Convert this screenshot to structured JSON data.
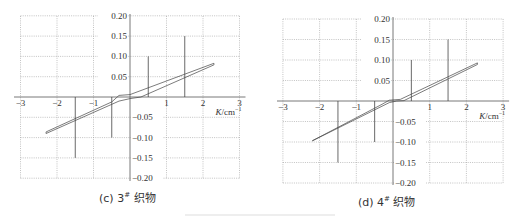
{
  "chart_data": [
    {
      "type": "line",
      "panel": "c",
      "caption": "(c) 3# 织物",
      "caption_parts": {
        "prefix": "(c) 3",
        "sup": "#",
        "suffix": " 织物"
      },
      "xlabel": "K/cm⁻¹",
      "ylabel": "",
      "xlim": [
        -3,
        3
      ],
      "ylim": [
        -0.2,
        0.2
      ],
      "x_ticks": [
        "−3",
        "−2",
        "−1",
        "1",
        "2",
        "3"
      ],
      "y_ticks_pos": [
        "0.20",
        "0.15",
        "0.10",
        "0.05"
      ],
      "y_ticks_neg": [
        "−0.05",
        "−0.10",
        "−0.15",
        "−0.20"
      ],
      "grid": true,
      "stems": [
        {
          "x": -1.5,
          "y": -0.15
        },
        {
          "x": -0.5,
          "y": -0.1
        },
        {
          "x": 0.5,
          "y": 0.1
        },
        {
          "x": 1.5,
          "y": 0.15
        }
      ],
      "series": [
        {
          "name": "upper branch",
          "points": [
            [
              -2.3,
              -0.086
            ],
            [
              -0.5,
              -0.012
            ],
            [
              -0.3,
              0.004
            ],
            [
              0.0,
              0.006
            ],
            [
              2.3,
              0.083
            ]
          ]
        },
        {
          "name": "lower branch",
          "points": [
            [
              -2.3,
              -0.09
            ],
            [
              -0.3,
              -0.01
            ],
            [
              0.0,
              -0.004
            ],
            [
              0.3,
              0.0
            ],
            [
              2.3,
              0.079
            ]
          ]
        }
      ]
    },
    {
      "type": "line",
      "panel": "d",
      "caption": "(d) 4# 织物",
      "caption_parts": {
        "prefix": "(d) 4",
        "sup": "#",
        "suffix": " 织物"
      },
      "xlabel": "K/cm⁻¹",
      "ylabel": "",
      "xlim": [
        -3,
        3
      ],
      "ylim": [
        -0.2,
        0.2
      ],
      "x_ticks": [
        "−3",
        "−2",
        "−1",
        "1",
        "2",
        "3"
      ],
      "y_ticks_pos": [
        "0.20",
        "0.15",
        "0.10",
        "0.05"
      ],
      "y_ticks_neg": [
        "−0.05",
        "−0.10",
        "−0.15",
        "−0.20"
      ],
      "grid": true,
      "stems": [
        {
          "x": -1.5,
          "y": -0.15
        },
        {
          "x": -0.5,
          "y": -0.1
        },
        {
          "x": 0.5,
          "y": 0.1
        },
        {
          "x": 1.5,
          "y": 0.15
        }
      ],
      "series": [
        {
          "name": "upper branch",
          "points": [
            [
              -2.2,
              -0.097
            ],
            [
              -0.3,
              -0.008
            ],
            [
              -0.1,
              0.002
            ],
            [
              0.2,
              0.004
            ],
            [
              2.3,
              0.093
            ]
          ]
        },
        {
          "name": "lower branch",
          "points": [
            [
              -2.2,
              -0.097
            ],
            [
              -0.1,
              -0.004
            ],
            [
              0.1,
              0.0
            ],
            [
              0.3,
              0.001
            ],
            [
              2.3,
              0.089
            ]
          ]
        }
      ]
    }
  ],
  "layout": {
    "c": {
      "x0": 130,
      "y0": 97,
      "px_per_x": 36.5,
      "px_per_y": 406,
      "left": 21,
      "right": 240,
      "top": 16,
      "bottom": 179,
      "axis_left": 14
    },
    "d": {
      "x0": 137,
      "y0": 101,
      "px_per_x": 36.7,
      "px_per_y": 410,
      "left": 28,
      "right": 248,
      "top": 19,
      "bottom": 183,
      "axis_left": 21
    }
  }
}
